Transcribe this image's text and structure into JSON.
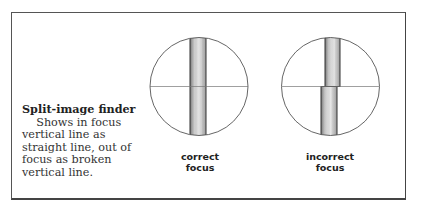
{
  "caption": {
    "title": "Split-image finder",
    "body": "Shows in focus vertical line as straight line, out of focus as broken vertical line."
  },
  "panels": [
    {
      "label_line1": "correct",
      "label_line2": "focus",
      "state": "in-focus"
    },
    {
      "label_line1": "incorrect",
      "label_line2": "focus",
      "state": "out-of-focus"
    }
  ],
  "colors": {
    "frame": "#555555",
    "circle": "#666666",
    "bar_fill": "#d8d8d8",
    "bar_stroke": "#333333"
  }
}
